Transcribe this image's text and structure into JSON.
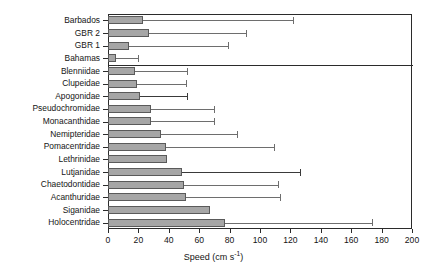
{
  "chart_data": {
    "type": "bar",
    "orientation": "horizontal",
    "title": "",
    "xlabel": "Speed (cm s-1)",
    "xlabel_base": "Speed (cm s",
    "xlabel_sup": "-1",
    "xlabel_tail": ")",
    "ylabel": "",
    "xlim": [
      0,
      200
    ],
    "xticks": [
      0,
      20,
      40,
      60,
      80,
      100,
      120,
      140,
      160,
      180,
      200
    ],
    "grid": false,
    "legend": null,
    "error_bars": "upper only (SD)",
    "bar_color": "#a6a6a6",
    "bar_edge_color": "#5a5a5a",
    "axis_color": "#2b2b2b",
    "group_separator_after": "Bahamas",
    "categories": [
      "Barbados",
      "GBR 2",
      "GBR 1",
      "Bahamas",
      "Blenniidae",
      "Clupeidae",
      "Apogonidae",
      "Pseudochromidae",
      "Monacanthidae",
      "Nemipteridae",
      "Pomacentridae",
      "Lethrinidae",
      "Lutjanidae",
      "Chaetodontidae",
      "Acanthuridae",
      "Siganidae",
      "Holocentridae"
    ],
    "values": [
      23,
      27,
      14,
      5,
      18,
      19,
      21,
      28,
      28,
      35,
      38,
      39,
      49,
      50,
      51,
      67,
      77
    ],
    "error_upper": [
      122,
      91,
      79,
      20,
      52,
      51,
      52,
      70,
      70,
      85,
      109,
      39,
      126,
      112,
      113,
      67,
      174
    ],
    "series": [
      {
        "name": "Mean speed",
        "points": [
          {
            "category": "Barbados",
            "value": 23,
            "upper": 122
          },
          {
            "category": "GBR 2",
            "value": 27,
            "upper": 91
          },
          {
            "category": "GBR 1",
            "value": 14,
            "upper": 79
          },
          {
            "category": "Bahamas",
            "value": 5,
            "upper": 20
          },
          {
            "category": "Blenniidae",
            "value": 18,
            "upper": 52
          },
          {
            "category": "Clupeidae",
            "value": 19,
            "upper": 51
          },
          {
            "category": "Apogonidae",
            "value": 21,
            "upper": 52
          },
          {
            "category": "Pseudochromidae",
            "value": 28,
            "upper": 70
          },
          {
            "category": "Monacanthidae",
            "value": 28,
            "upper": 70
          },
          {
            "category": "Nemipteridae",
            "value": 35,
            "upper": 85
          },
          {
            "category": "Pomacentridae",
            "value": 38,
            "upper": 109
          },
          {
            "category": "Lethrinidae",
            "value": 39,
            "upper": 39
          },
          {
            "category": "Lutjanidae",
            "value": 49,
            "upper": 126
          },
          {
            "category": "Chaetodontidae",
            "value": 50,
            "upper": 112
          },
          {
            "category": "Acanthuridae",
            "value": 51,
            "upper": 113
          },
          {
            "category": "Siganidae",
            "value": 67,
            "upper": 67
          },
          {
            "category": "Holocentridae",
            "value": 77,
            "upper": 174
          }
        ]
      }
    ]
  }
}
